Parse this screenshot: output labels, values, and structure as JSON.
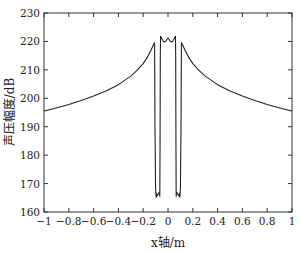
{
  "chart_data": {
    "type": "line",
    "title": "",
    "xlabel": "x轴/m",
    "ylabel": "声压幅度/dB",
    "xlim": [
      -1,
      1
    ],
    "ylim": [
      160,
      230
    ],
    "grid": false,
    "legend": null,
    "x_ticks": [
      -1,
      -0.8,
      -0.6,
      -0.4,
      -0.2,
      0,
      0.2,
      0.4,
      0.6,
      0.8,
      1
    ],
    "x_tick_labels": [
      "−1",
      "−0.8",
      "−0.6",
      "−0.4",
      "−0.2",
      "0",
      "0.2",
      "0.4",
      "0.6",
      "0.8",
      "1"
    ],
    "y_ticks": [
      160,
      170,
      180,
      190,
      200,
      210,
      220,
      230
    ],
    "y_tick_labels": [
      "160",
      "170",
      "180",
      "190",
      "200",
      "210",
      "220",
      "230"
    ],
    "series": [
      {
        "name": "sound-pressure-amplitude",
        "color": "#222222",
        "x": [
          -1,
          -0.9,
          -0.8,
          -0.7,
          -0.6,
          -0.5,
          -0.4,
          -0.3,
          -0.25,
          -0.2,
          -0.17,
          -0.14,
          -0.12,
          -0.11,
          -0.108,
          -0.105,
          -0.1,
          -0.095,
          -0.092,
          -0.09,
          -0.085,
          -0.075,
          -0.07,
          -0.066,
          -0.064,
          -0.062,
          -0.06,
          -0.055,
          -0.05,
          -0.04,
          -0.03,
          -0.02,
          -0.01,
          0,
          0.01,
          0.02,
          0.03,
          0.04,
          0.05,
          0.055,
          0.06,
          0.062,
          0.064,
          0.066,
          0.07,
          0.075,
          0.085,
          0.09,
          0.092,
          0.095,
          0.1,
          0.105,
          0.108,
          0.11,
          0.12,
          0.14,
          0.17,
          0.2,
          0.25,
          0.3,
          0.4,
          0.5,
          0.6,
          0.7,
          0.8,
          0.9,
          1
        ],
        "y": [
          195.5,
          196.6,
          197.8,
          199.2,
          200.8,
          202.6,
          204.8,
          207.8,
          209.8,
          212.2,
          214.2,
          216.6,
          218.6,
          219.5,
          218.5,
          190,
          168,
          165.2,
          166.5,
          165.5,
          166,
          166.5,
          167,
          165.5,
          185,
          215,
          221.8,
          221.5,
          221,
          220.2,
          219.8,
          220,
          220.6,
          221.2,
          220.6,
          220,
          219.8,
          220.2,
          221,
          221.5,
          221.8,
          215,
          185,
          165.5,
          167,
          166.5,
          166,
          165.5,
          166.5,
          165.2,
          168,
          190,
          218.5,
          219.5,
          218.6,
          216.6,
          214.2,
          212.2,
          209.8,
          207.8,
          204.8,
          202.6,
          200.8,
          199.2,
          197.8,
          196.6,
          195.5
        ]
      }
    ]
  }
}
